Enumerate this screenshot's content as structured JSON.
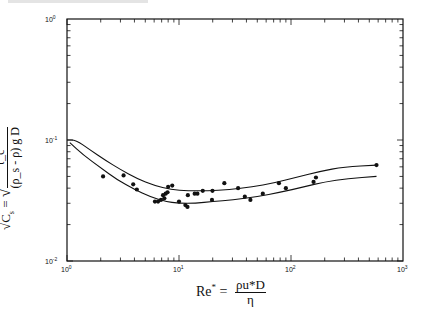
{
  "chart_data": {
    "type": "scatter",
    "title": "",
    "xlabel": "Re* = ρu*D / η",
    "xlabel_parts": {
      "lhs": "Re",
      "sup": "*",
      "eq": "=",
      "numerator": "ρu*D",
      "denominator": "η"
    },
    "ylabel": "√C_s = √( τ_c / ((ρ_s − ρ) g D) )",
    "ylabel_parts": {
      "lhs": "√C",
      "sub": "s",
      "eq": "=",
      "numerator": "τ_c",
      "denominator": "(ρ_s - ρ) g D"
    },
    "xscale": "log",
    "yscale": "log",
    "xlim": [
      1,
      1000
    ],
    "ylim": [
      0.01,
      1
    ],
    "grid": false,
    "legend": null,
    "x_ticks": [
      {
        "base": "10",
        "exp": "0",
        "value": 1
      },
      {
        "base": "10",
        "exp": "1",
        "value": 10
      },
      {
        "base": "10",
        "exp": "2",
        "value": 100
      },
      {
        "base": "10",
        "exp": "3",
        "value": 1000
      }
    ],
    "y_ticks": [
      {
        "base": "10",
        "exp": "-2",
        "value": 0.01
      },
      {
        "base": "10",
        "exp": "-1",
        "value": 0.1
      },
      {
        "base": "10",
        "exp": "0",
        "value": 1
      }
    ],
    "series": [
      {
        "name": "Upper envelope curve",
        "kind": "line",
        "x": [
          1.0,
          1.2,
          1.6,
          2.2,
          3.0,
          4.2,
          6.0,
          8.5,
          12,
          18,
          28,
          45,
          70,
          110,
          180,
          300,
          580
        ],
        "y": [
          0.1,
          0.1,
          0.083,
          0.068,
          0.057,
          0.048,
          0.042,
          0.039,
          0.038,
          0.038,
          0.039,
          0.041,
          0.044,
          0.049,
          0.055,
          0.06,
          0.062
        ]
      },
      {
        "name": "Lower envelope curve",
        "kind": "line",
        "x": [
          1.06,
          1.4,
          2.0,
          2.8,
          4.0,
          5.5,
          7.5,
          10,
          14,
          20,
          30,
          50,
          80,
          130,
          200,
          320,
          580
        ],
        "y": [
          0.095,
          0.075,
          0.059,
          0.047,
          0.039,
          0.034,
          0.031,
          0.03,
          0.03,
          0.031,
          0.032,
          0.034,
          0.037,
          0.041,
          0.045,
          0.048,
          0.05
        ]
      },
      {
        "name": "Measured data",
        "kind": "points",
        "x": [
          2.1,
          3.2,
          3.9,
          4.2,
          6.1,
          6.5,
          6.9,
          7.2,
          7.6,
          7.9,
          8.0,
          8.7,
          7.4,
          10.0,
          11.4,
          11.9,
          12.0,
          13.8,
          14.6,
          16.3,
          19.9,
          19.7,
          25.4,
          33.7,
          38.7,
          43.4,
          56,
          78,
          90,
          159,
          167,
          580
        ],
        "y": [
          0.05,
          0.051,
          0.043,
          0.039,
          0.031,
          0.031,
          0.032,
          0.035,
          0.036,
          0.037,
          0.041,
          0.042,
          0.033,
          0.031,
          0.029,
          0.028,
          0.035,
          0.036,
          0.036,
          0.038,
          0.038,
          0.032,
          0.044,
          0.04,
          0.034,
          0.032,
          0.036,
          0.044,
          0.04,
          0.045,
          0.049,
          0.062
        ]
      }
    ]
  }
}
